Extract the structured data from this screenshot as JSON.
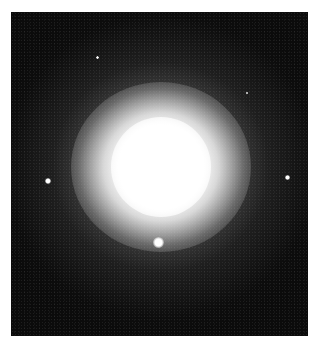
{
  "image": {
    "subject": "elliptical galaxy",
    "background_color": "#0b0b0b",
    "border_color": "#ffffff",
    "galaxy_center": [
      160,
      165
    ],
    "stars": [
      {
        "name": "star-left",
        "x": 48,
        "y": 181,
        "size": 6
      },
      {
        "name": "star-right",
        "x": 287,
        "y": 177,
        "size": 5
      },
      {
        "name": "star-bottom",
        "x": 158,
        "y": 242,
        "size": 11
      },
      {
        "name": "star-top-small",
        "x": 97,
        "y": 57,
        "size": 3
      },
      {
        "name": "star-upper-right-small",
        "x": 247,
        "y": 93,
        "size": 2
      }
    ]
  }
}
